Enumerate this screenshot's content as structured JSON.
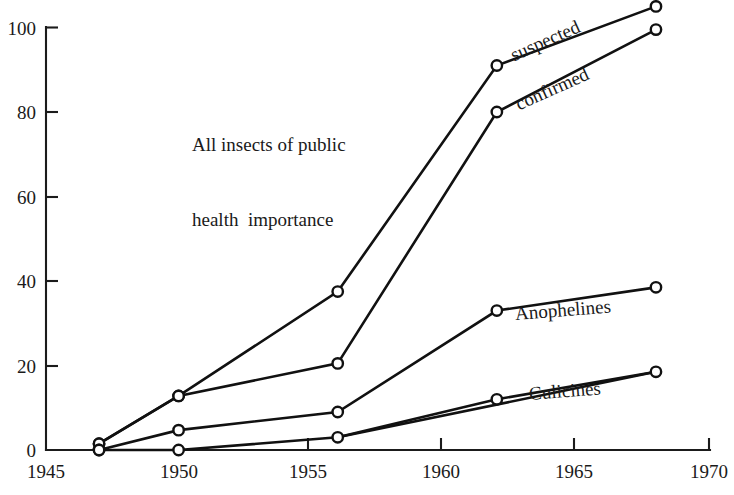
{
  "chart_data": {
    "type": "line",
    "title": "",
    "caption_lines": [
      "All insects of public",
      "health  importance"
    ],
    "xlabel": "",
    "ylabel": "",
    "xlim": [
      1945,
      1970
    ],
    "ylim": [
      0,
      100
    ],
    "xticks": [
      1945,
      1950,
      1955,
      1960,
      1965,
      1970
    ],
    "xtick_labels": [
      "1945",
      "1950",
      "1955",
      "1960",
      "1965",
      "1970"
    ],
    "yticks": [
      0,
      20,
      40,
      60,
      80,
      100
    ],
    "ytick_labels": [
      "0",
      "20",
      "40",
      "60",
      "80",
      "100"
    ],
    "grid": false,
    "legend_position": "inline-labels",
    "marker": "open-circle",
    "line_color": "#111111",
    "marker_fill": "#ffffff",
    "series": [
      {
        "name": "suspected",
        "label": "suspected",
        "x": [
          1947,
          1950,
          1956,
          1962,
          1968
        ],
        "values": [
          1.5,
          12.8,
          37.5,
          91,
          105
        ]
      },
      {
        "name": "confirmed",
        "label": "confirmed",
        "x": [
          1947,
          1950,
          1956,
          1962,
          1968
        ],
        "values": [
          1.5,
          12.8,
          20.5,
          80,
          99.5
        ]
      },
      {
        "name": "Anophelines",
        "label": "Anophelines",
        "x": [
          1947,
          1950,
          1956,
          1962,
          1968
        ],
        "values": [
          0,
          4.7,
          9,
          33,
          38.5
        ]
      },
      {
        "name": "Culicines",
        "label": "Culicines",
        "x": [
          1947,
          1950,
          1956,
          1968
        ],
        "values": [
          0,
          0,
          3,
          18.5
        ]
      },
      {
        "name": "Culicines-1962",
        "label": "",
        "x": [
          1956,
          1962,
          1968
        ],
        "values": [
          3,
          12,
          18.5
        ]
      }
    ]
  }
}
